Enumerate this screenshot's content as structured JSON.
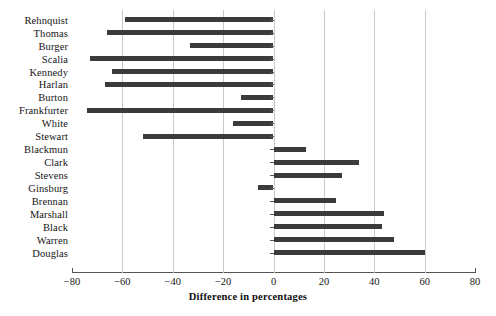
{
  "chart_data": {
    "type": "bar",
    "orientation": "horizontal",
    "title": "",
    "xlabel": "Difference in percentages",
    "ylabel": "",
    "xlim": [
      -80,
      80
    ],
    "xticks": [
      -80,
      -60,
      -40,
      -20,
      0,
      20,
      40,
      60,
      80
    ],
    "xticklabels": [
      "−80",
      "−60",
      "−40",
      "−20",
      "0",
      "20",
      "40",
      "60",
      "80"
    ],
    "grid": "vertical-only",
    "legend": "none",
    "bar_color": "#3b3b3b",
    "categories": [
      "Rehnquist",
      "Thomas",
      "Burger",
      "Scalia",
      "Kennedy",
      "Harlan",
      "Burton",
      "Frankfurter",
      "White",
      "Stewart",
      "Blackmun",
      "Clark",
      "Stevens",
      "Ginsburg",
      "Brennan",
      "Marshall",
      "Black",
      "Warren",
      "Douglas"
    ],
    "values": [
      -59,
      -66,
      -33,
      -73,
      -64,
      -67,
      -13,
      -74,
      -16,
      -52,
      13,
      34,
      27,
      -6,
      25,
      44,
      43,
      48,
      60
    ]
  }
}
